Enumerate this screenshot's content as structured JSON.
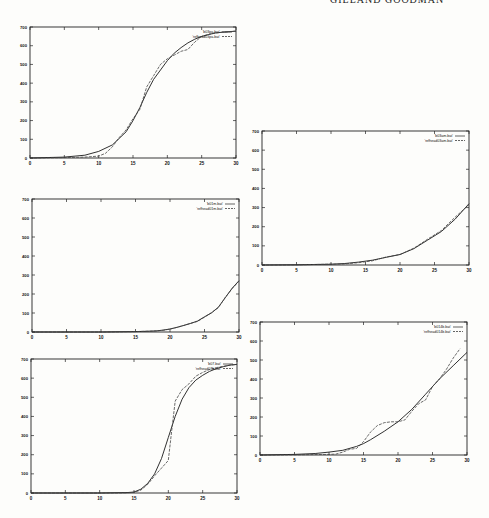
{
  "page": {
    "header_text": "GILLAND  GOODMAN"
  },
  "chart_data": [
    {
      "id": "top-left",
      "type": "line",
      "box": {
        "left": 30,
        "top": 27,
        "right": 236,
        "bottom": 158
      },
      "xlim": [
        0,
        30
      ],
      "ylim": [
        0,
        700
      ],
      "xticks": [
        0,
        5,
        10,
        15,
        20,
        25,
        30
      ],
      "yticks": [
        0,
        100,
        200,
        300,
        400,
        500,
        600,
        700
      ],
      "grid": false,
      "legend_position": "top-right",
      "series": [
        {
          "name": "'b03pa.bat'",
          "style": "solid",
          "x": [
            0,
            5,
            8,
            10,
            12,
            14,
            15,
            16,
            17,
            18,
            19,
            20,
            21,
            22,
            23,
            24,
            25,
            26,
            27,
            28,
            29,
            30
          ],
          "y": [
            0,
            5,
            15,
            35,
            70,
            140,
            200,
            270,
            350,
            420,
            470,
            520,
            560,
            590,
            615,
            635,
            650,
            660,
            668,
            672,
            675,
            678
          ]
        },
        {
          "name": "'refhead03pa.bat'",
          "style": "dashed",
          "x": [
            0,
            5,
            8,
            10,
            11,
            12,
            13,
            14,
            15,
            16,
            17,
            18,
            19,
            20,
            21,
            22,
            23,
            24,
            25,
            26,
            27,
            28,
            29,
            30
          ],
          "y": [
            0,
            2,
            5,
            10,
            25,
            60,
            110,
            150,
            210,
            260,
            380,
            440,
            500,
            530,
            550,
            570,
            580,
            620,
            650,
            660,
            668,
            672,
            675,
            678
          ]
        }
      ]
    },
    {
      "id": "right-top",
      "type": "line",
      "box": {
        "left": 262,
        "top": 131,
        "right": 469,
        "bottom": 265
      },
      "xlim": [
        0,
        30
      ],
      "ylim": [
        0,
        700
      ],
      "xticks": [
        0,
        5,
        10,
        15,
        20,
        25,
        30
      ],
      "yticks": [
        0,
        100,
        200,
        300,
        400,
        500,
        600,
        700
      ],
      "grid": false,
      "legend_position": "top-right",
      "series": [
        {
          "name": "'b03am.bat'",
          "style": "solid",
          "x": [
            0,
            5,
            10,
            12,
            14,
            16,
            18,
            20,
            22,
            24,
            26,
            28,
            30
          ],
          "y": [
            0,
            1,
            4,
            8,
            15,
            25,
            40,
            55,
            85,
            130,
            175,
            240,
            320
          ]
        },
        {
          "name": "'refhead03am.bat'",
          "style": "dashed",
          "x": [
            0,
            5,
            10,
            12,
            14,
            16,
            18,
            20,
            22,
            24,
            26,
            28,
            30
          ],
          "y": [
            0,
            1,
            4,
            6,
            12,
            22,
            42,
            55,
            88,
            135,
            180,
            250,
            315
          ]
        }
      ]
    },
    {
      "id": "left-middle",
      "type": "line",
      "box": {
        "left": 32,
        "top": 199,
        "right": 239,
        "bottom": 332
      },
      "xlim": [
        0,
        30
      ],
      "ylim": [
        0,
        700
      ],
      "xticks": [
        0,
        5,
        10,
        15,
        20,
        25,
        30
      ],
      "yticks": [
        0,
        100,
        200,
        300,
        400,
        500,
        600,
        700
      ],
      "grid": false,
      "legend_position": "top-right",
      "series": [
        {
          "name": "'b01m.bat'",
          "style": "solid",
          "x": [
            0,
            10,
            15,
            17,
            18,
            19,
            20,
            21,
            22,
            23,
            24,
            25,
            26,
            27,
            28,
            29,
            30
          ],
          "y": [
            0,
            0,
            2,
            4,
            6,
            10,
            16,
            24,
            35,
            45,
            58,
            80,
            100,
            130,
            180,
            230,
            270
          ]
        },
        {
          "name": "'refhead01m.bat'",
          "style": "dashed",
          "x": [
            0,
            10,
            15,
            17,
            18,
            19,
            20,
            21,
            22,
            23,
            24,
            25,
            26,
            27,
            28,
            29,
            30
          ],
          "y": [
            0,
            0,
            2,
            4,
            6,
            9,
            15,
            25,
            34,
            46,
            56,
            78,
            102,
            128,
            182,
            228,
            268
          ]
        }
      ]
    },
    {
      "id": "left-bottom",
      "type": "line",
      "box": {
        "left": 31,
        "top": 359,
        "right": 237,
        "bottom": 493
      },
      "xlim": [
        0,
        30
      ],
      "ylim": [
        0,
        700
      ],
      "xticks": [
        0,
        5,
        10,
        15,
        20,
        25,
        30
      ],
      "yticks": [
        0,
        100,
        200,
        300,
        400,
        500,
        600,
        700
      ],
      "grid": false,
      "legend_position": "top-right",
      "series": [
        {
          "name": "'b07.bat'",
          "style": "solid",
          "x": [
            0,
            10,
            14,
            15,
            16,
            17,
            18,
            19,
            20,
            21,
            22,
            23,
            24,
            25,
            26,
            27,
            28,
            29,
            30
          ],
          "y": [
            0,
            0,
            2,
            5,
            20,
            50,
            100,
            180,
            290,
            400,
            490,
            550,
            590,
            615,
            635,
            650,
            660,
            668,
            672
          ]
        },
        {
          "name": "'refhead07b.bat'",
          "style": "dashed",
          "x": [
            0,
            10,
            14,
            15,
            16,
            17,
            18,
            19,
            20,
            20.5,
            21,
            22,
            23,
            24,
            25,
            26,
            27,
            28,
            29,
            30
          ],
          "y": [
            0,
            0,
            1,
            3,
            15,
            45,
            90,
            130,
            170,
            330,
            480,
            540,
            570,
            610,
            630,
            645,
            655,
            662,
            668,
            672
          ]
        }
      ]
    },
    {
      "id": "right-bottom",
      "type": "line",
      "box": {
        "left": 260,
        "top": 322,
        "right": 467,
        "bottom": 455
      },
      "xlim": [
        0,
        30
      ],
      "ylim": [
        0,
        700
      ],
      "xticks": [
        0,
        5,
        10,
        15,
        20,
        25,
        30
      ],
      "yticks": [
        0,
        100,
        200,
        300,
        400,
        500,
        600,
        700
      ],
      "grid": false,
      "legend_position": "top-right",
      "series": [
        {
          "name": "'b014b.bat'",
          "style": "solid",
          "x": [
            0,
            5,
            8,
            10,
            12,
            14,
            15,
            16,
            18,
            20,
            22,
            24,
            26,
            28,
            30
          ],
          "y": [
            0,
            3,
            8,
            15,
            25,
            45,
            60,
            80,
            125,
            175,
            240,
            320,
            400,
            470,
            540
          ]
        },
        {
          "name": "'refhead014b.bat'",
          "style": "dashed",
          "x": [
            0,
            5,
            10,
            11,
            12,
            13,
            14,
            15,
            16,
            17,
            18,
            19,
            20,
            21,
            22,
            23,
            24,
            25,
            26,
            27,
            28,
            29
          ],
          "y": [
            0,
            1,
            3,
            5,
            15,
            30,
            35,
            70,
            120,
            155,
            170,
            175,
            175,
            185,
            230,
            270,
            290,
            360,
            400,
            450,
            510,
            560
          ]
        }
      ]
    }
  ]
}
